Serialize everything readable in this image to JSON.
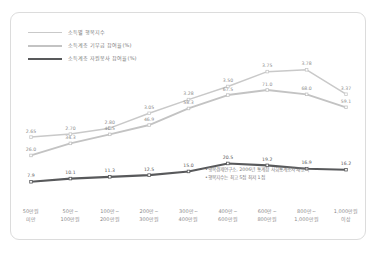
{
  "chart_data": {
    "type": "line",
    "title": "",
    "xlabel": "",
    "ylabel": "",
    "grid": false,
    "legend_position": "top-left",
    "categories": [
      "50만원\n미만",
      "50만~\n100만원",
      "100만~\n200만원",
      "200만~\n300만원",
      "300만~\n400만원",
      "400만~\n600만원",
      "600만~\n800만원",
      "800만~\n1,000만원",
      "1,000만원\n이상"
    ],
    "category_lines": [
      [
        "50만원",
        "미만"
      ],
      [
        "50만~",
        "100만원"
      ],
      [
        "100만~",
        "200만원"
      ],
      [
        "200만~",
        "300만원"
      ],
      [
        "300만~",
        "400만원"
      ],
      [
        "400만~",
        "600만원"
      ],
      [
        "600만~",
        "800만원"
      ],
      [
        "800만~",
        "1,000만원"
      ],
      [
        "1,000만원",
        "이상"
      ]
    ],
    "series": [
      {
        "name": "소득별 행복지수",
        "color": "#c9c9c9",
        "axis": "index",
        "values": [
          2.65,
          2.7,
          2.8,
          3.05,
          3.28,
          3.5,
          3.75,
          3.78,
          3.37
        ],
        "labels": [
          "2.65",
          "2.70",
          "2.80",
          "3.05",
          "3.28",
          "3.50",
          "3.75",
          "3.78",
          "3.37"
        ]
      },
      {
        "name": "소득계층 기부금 참여율(%)",
        "color": "#c3c3c3",
        "axis": "percent",
        "values": [
          26.0,
          34.3,
          40.5,
          46.9,
          58.3,
          67.5,
          71.0,
          68.0,
          59.1
        ],
        "labels": [
          "26.0",
          "34.3",
          "40.5",
          "46.9",
          "58.3",
          "67.5",
          "67.5",
          "68.0",
          "59.1"
        ]
      },
      {
        "name": "소득계층 자원봉사 참여율(%)",
        "color": "#58595b",
        "axis": "percent",
        "values": [
          7.9,
          10.1,
          11.3,
          12.5,
          15.0,
          20.5,
          19.2,
          16.9,
          16.2
        ],
        "labels": [
          "7.9",
          "10.1",
          "11.3",
          "12.5",
          "15.0",
          "20.5",
          "19.2",
          "16.9",
          "16.2"
        ]
      }
    ],
    "series_display_labels": {
      "happiness": [
        "2.65",
        "2.70",
        "2.80",
        "3.05",
        "3.28",
        "3.50",
        "3.75",
        "3.78",
        "3.37"
      ],
      "donation": [
        "26.0",
        "34.3",
        "40.5",
        "46.9",
        "58.3",
        "67.5",
        "71.0",
        "68.0",
        "59.1"
      ],
      "volunteer": [
        "7.9",
        "10.1",
        "11.3",
        "12.5",
        "15.0",
        "20.5",
        "19.2",
        "16.9",
        "16.2"
      ]
    },
    "annotations": [
      "•행복경제연구소, 2006년 통계청 사회통계조사 재분석",
      "•행복지수는 최고 5점 최저 1점"
    ]
  },
  "legend": {
    "items": [
      {
        "label": "소득별 행복지수",
        "color": "#c9c9c9",
        "width": "1.6px"
      },
      {
        "label": "소득계층 기부금 참여율(%)",
        "color": "#c3c3c3",
        "width": "2.2px"
      },
      {
        "label": "소득계층 자원봉사 참여율(%)",
        "color": "#58595b",
        "width": "2.6px"
      }
    ]
  }
}
